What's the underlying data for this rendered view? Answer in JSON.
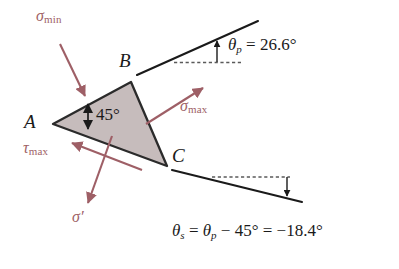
{
  "figure": {
    "type": "stress-element-orientation-diagram",
    "background_color": "#ffffff",
    "wedge": {
      "fill_color": "#c6bcbc",
      "stroke_color": "#2b2b2b",
      "vertices": [
        {
          "label": "A",
          "x": 53,
          "y": 124
        },
        {
          "label": "B",
          "x": 131,
          "y": 82
        },
        {
          "label": "C",
          "x": 167,
          "y": 166
        }
      ],
      "interior_angle_label": "45°"
    },
    "vertex_labels": {
      "a": "A",
      "b": "B",
      "c": "C"
    },
    "stress_color": "#9e5f66",
    "stresses": [
      {
        "name": "sigma-min",
        "symbol": "σ",
        "subscript": "min",
        "direction": "down-right, into face AB"
      },
      {
        "name": "sigma-max",
        "symbol": "σ",
        "subscript": "max",
        "direction": "up-right, out of face BC"
      },
      {
        "name": "tau-max",
        "symbol": "τ",
        "subscript": "max",
        "direction": "up-left, along face AC"
      },
      {
        "name": "sigma-prime",
        "symbol": "σ",
        "subscript": "′",
        "direction": "down-left, normal to face AC"
      }
    ],
    "annotations": {
      "theta_p": {
        "symbol": "θ",
        "subscript": "p",
        "equals": "=",
        "value": "26.6°",
        "full": "θp = 26.6°"
      },
      "theta_s": {
        "symbol": "θ",
        "subscript": "s",
        "full": "θs = θp − 45° = −18.4°",
        "part_equals_1": "=",
        "part_theta_p_symbol": "θ",
        "part_theta_p_sub": "p",
        "part_minus": "− 45°",
        "part_equals_2": "=",
        "part_value": "−18.4°"
      },
      "interior_angle": "45°"
    }
  }
}
